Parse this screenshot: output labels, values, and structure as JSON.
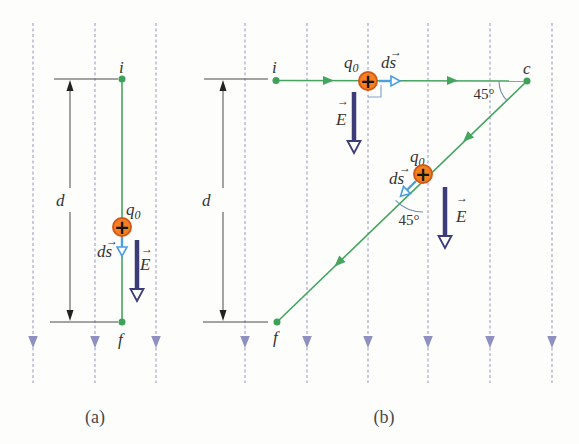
{
  "colors": {
    "field_line": "#a8a8d0",
    "field_arrow": "#8f8fc0",
    "path_green": "#45a45f",
    "point_green": "#3da257",
    "ds_blue": "#4a9fe0",
    "e_vector_dark_blue": "#3c3c79",
    "charge_fill": "#f48120",
    "charge_rim": "#d4571c",
    "dimension_black": "#4a4a4a",
    "angle_marker_blue_gray": "#6f8fae",
    "background": "#fdfdfb"
  },
  "panel_a": {
    "caption": "(a)",
    "point_i": "i",
    "point_f": "f",
    "dimension_label": "d",
    "charge_label": "q",
    "charge_label_sub": "0",
    "charge_sign": "+",
    "ds_label": "ds",
    "ds_arrow": "→",
    "e_label": "E",
    "e_arrow": "→"
  },
  "panel_b": {
    "caption": "(b)",
    "point_i": "i",
    "point_f": "f",
    "point_c": "c",
    "dimension_label": "d",
    "angle_at_c": "45°",
    "angle_on_path": "45°",
    "charge1_label": "q",
    "charge1_label_sub": "0",
    "charge1_sign": "+",
    "ds1_label": "ds",
    "ds1_arrow": "→",
    "e1_label": "E",
    "e1_arrow": "→",
    "charge2_label": "q",
    "charge2_label_sub": "0",
    "charge2_sign": "+",
    "ds2_label": "ds",
    "ds2_arrow": "→",
    "e2_label": "E",
    "e2_arrow": "→"
  }
}
